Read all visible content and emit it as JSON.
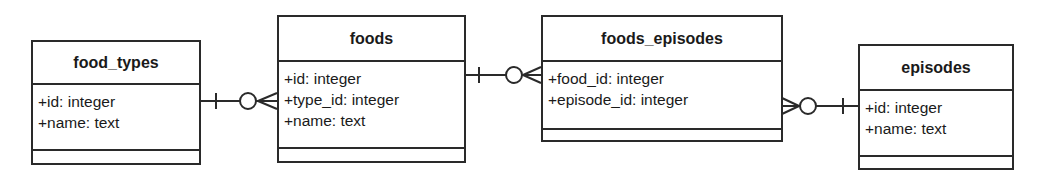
{
  "entities": [
    {
      "name": "food_types",
      "box": {
        "x": 31,
        "y": 40,
        "w": 170,
        "h": 125,
        "hdr": 43,
        "attrs": 66
      },
      "attributes": [
        "+id: integer",
        "+name: text"
      ]
    },
    {
      "name": "foods",
      "box": {
        "x": 277,
        "y": 15,
        "w": 189,
        "h": 148,
        "hdr": 45,
        "attrs": 87
      },
      "attributes": [
        "+id: integer",
        "+type_id: integer",
        "+name: text"
      ]
    },
    {
      "name": "foods_episodes",
      "box": {
        "x": 541,
        "y": 15,
        "w": 242,
        "h": 127,
        "hdr": 45,
        "attrs": 68
      },
      "attributes": [
        "+food_id: integer",
        "+episode_id: integer"
      ]
    },
    {
      "name": "episodes",
      "box": {
        "x": 858,
        "y": 44,
        "w": 156,
        "h": 126,
        "hdr": 45,
        "attrs": 66
      },
      "attributes": [
        "+id: integer",
        "+name: text"
      ]
    }
  ],
  "relationships": [
    {
      "from": "food_types",
      "to": "foods",
      "from_cardinality": "one",
      "to_cardinality": "zero-or-many",
      "y": 101
    },
    {
      "from": "foods",
      "to": "foods_episodes",
      "from_cardinality": "one",
      "to_cardinality": "zero-or-many",
      "y": 75
    },
    {
      "from": "episodes",
      "to": "foods_episodes",
      "from_cardinality": "one",
      "to_cardinality": "zero-or-many",
      "y": 106
    }
  ],
  "labels": {
    "e0": {
      "name": "food_types",
      "a0": "+id: integer",
      "a1": "+name: text"
    },
    "e1": {
      "name": "foods",
      "a0": "+id: integer",
      "a1": "+type_id: integer",
      "a2": "+name: text"
    },
    "e2": {
      "name": "foods_episodes",
      "a0": "+food_id: integer",
      "a1": "+episode_id: integer"
    },
    "e3": {
      "name": "episodes",
      "a0": "+id: integer",
      "a1": "+name: text"
    }
  }
}
